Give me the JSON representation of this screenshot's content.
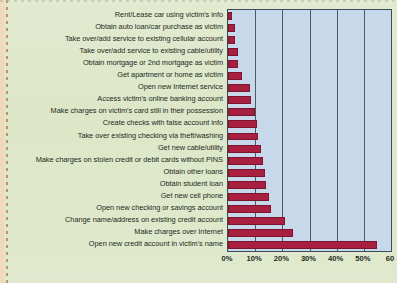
{
  "chart_data": {
    "type": "bar",
    "orientation": "horizontal",
    "title": "",
    "subtitle": "",
    "xlabel": "",
    "ylabel": "",
    "xlim": [
      0,
      60
    ],
    "xticks": [
      "0%",
      "10%",
      "20%",
      "30%",
      "40%",
      "50%",
      "60"
    ],
    "xtick_values": [
      0,
      10,
      20,
      30,
      40,
      50,
      60
    ],
    "grid": true,
    "legend": null,
    "legend_position": "none",
    "bar_color": "#a82040",
    "plot_background": "#c6d8ea",
    "page_background": "#e0e9cd",
    "axis_color": "#3d4a58",
    "categories": [
      "Rent/Lease car using victim's info",
      "Obtain auto loan/car purchase as victim",
      "Take over/add service to existing cellular account",
      "Take over/add service to existing cable/utility",
      "Obtain mortgage or 2nd mortgage as victim",
      "Get apartment or home as victim",
      "Open new Internet service",
      "Access victim's online banking account",
      "Make charges on victim's card still in their possession",
      "Create checks with false account info",
      "Take over existing checking via theft/washing",
      "Get new cable/utility",
      "Make charges on stolen credit or debit cards without PINS",
      "Obtain other loans",
      "Obtain student loan",
      "Get new cell phone",
      "Open new checking or savings account",
      "Change name/address on existing credit account",
      "Make charges over Internet",
      "Open new credit account in victim's name"
    ],
    "values": [
      1.5,
      2.5,
      2.6,
      3.5,
      3.6,
      5,
      8,
      8.5,
      10,
      10.5,
      11,
      12,
      13,
      13.5,
      14,
      15,
      16,
      21,
      24,
      55
    ]
  }
}
